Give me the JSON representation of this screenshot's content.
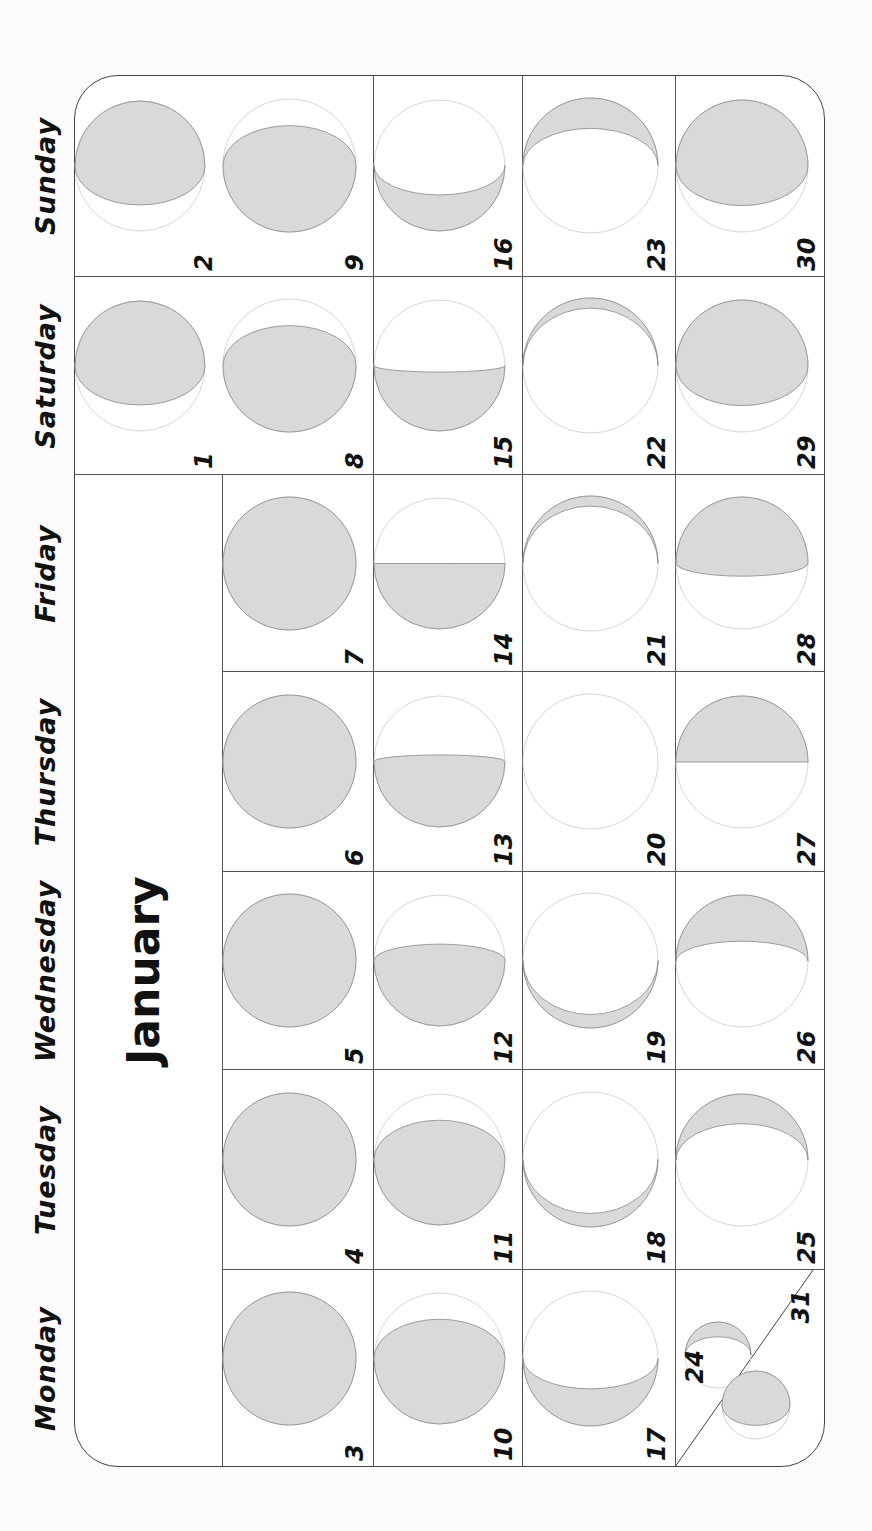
{
  "calendar": {
    "month": "January",
    "weekdays": [
      "Monday",
      "Tuesday",
      "Wednesday",
      "Thursday",
      "Friday",
      "Saturday",
      "Sunday"
    ],
    "colors": {
      "moon_fill": "#d9d9d9",
      "moon_edge": "#888888",
      "grid": "#555555",
      "text": "#111111"
    },
    "weeks": [
      [
        null,
        null,
        null,
        null,
        null,
        {
          "day": "1",
          "phase": "gibbous-top"
        },
        {
          "day": "2",
          "phase": "gibbous-top"
        }
      ],
      [
        {
          "day": "3",
          "phase": "full"
        },
        {
          "day": "4",
          "phase": "full"
        },
        {
          "day": "5",
          "phase": "full"
        },
        {
          "day": "6",
          "phase": "full"
        },
        {
          "day": "7",
          "phase": "full"
        },
        {
          "day": "8",
          "phase": "gibbous-bottom"
        },
        {
          "day": "9",
          "phase": "gibbous-bottom"
        }
      ],
      [
        {
          "day": "10",
          "phase": "gibbous-bottom"
        },
        {
          "day": "11",
          "phase": "gibbous-bottom"
        },
        {
          "day": "12",
          "phase": "gibbous-bottom-large"
        },
        {
          "day": "13",
          "phase": "half-bottom-plus"
        },
        {
          "day": "14",
          "phase": "half-bottom"
        },
        {
          "day": "15",
          "phase": "half-bottom-minus"
        },
        {
          "day": "16",
          "phase": "crescent-bottom"
        }
      ],
      [
        {
          "day": "17",
          "phase": "crescent-bottom"
        },
        {
          "day": "18",
          "phase": "crescent-bottom-thin"
        },
        {
          "day": "19",
          "phase": "crescent-bottom-thin"
        },
        {
          "day": "20",
          "phase": "new"
        },
        {
          "day": "21",
          "phase": "crescent-top-thin"
        },
        {
          "day": "22",
          "phase": "crescent-top-thin"
        },
        {
          "day": "23",
          "phase": "crescent-top"
        }
      ],
      [
        {
          "day": "24",
          "phase": "crescent-top",
          "shared_with": {
            "day": "31",
            "phase": "gibbous-top"
          }
        },
        {
          "day": "25",
          "phase": "crescent-top"
        },
        {
          "day": "26",
          "phase": "crescent-top-wide"
        },
        {
          "day": "27",
          "phase": "half-top"
        },
        {
          "day": "28",
          "phase": "half-top-plus"
        },
        {
          "day": "29",
          "phase": "gibbous-top"
        },
        {
          "day": "30",
          "phase": "gibbous-top"
        }
      ]
    ]
  }
}
